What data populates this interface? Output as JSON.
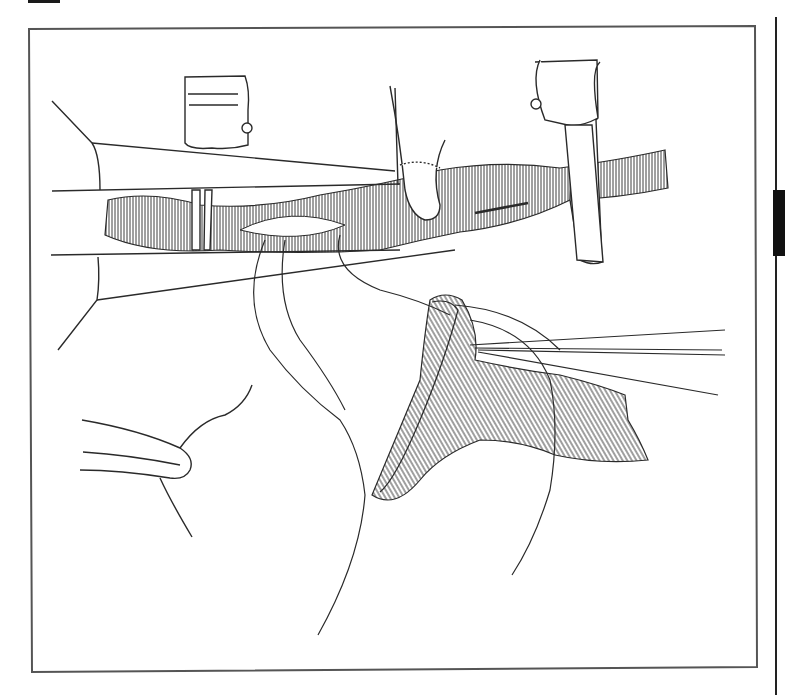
{
  "figure": {
    "type": "surgical-line-illustration",
    "colors": {
      "ink": "#2a2a2a",
      "paper": "#ffffff",
      "frame": "#555555",
      "tab": "#111111"
    },
    "elements": [
      {
        "name": "left-vascular-clamp"
      },
      {
        "name": "right-vascular-clamp"
      },
      {
        "name": "retractor-blades"
      },
      {
        "name": "forceps"
      },
      {
        "name": "host-vessel"
      },
      {
        "name": "graft-patch"
      },
      {
        "name": "suture-threads"
      },
      {
        "name": "needle-holder"
      }
    ]
  }
}
